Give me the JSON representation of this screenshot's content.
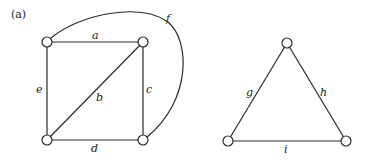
{
  "figure_label": "(a)",
  "graph1": {
    "edges": {
      "a": "a",
      "b": "b",
      "c": "c",
      "d": "d",
      "e": "e",
      "f": "f"
    }
  },
  "graph2": {
    "edges": {
      "g": "g",
      "h": "h",
      "i": "i"
    }
  }
}
